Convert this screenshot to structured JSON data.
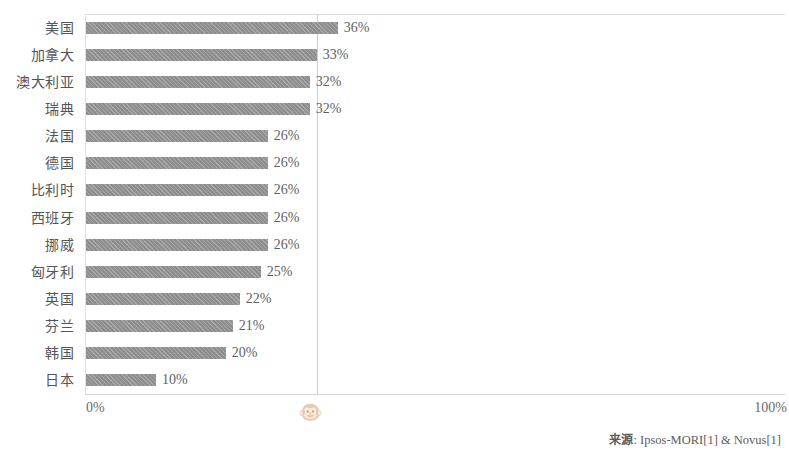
{
  "chart_data": {
    "type": "bar",
    "orientation": "horizontal",
    "title": "",
    "subtitle": "",
    "xlabel": "",
    "ylabel": "",
    "xlim": [
      0,
      100
    ],
    "x_tick_labels": [
      "0%",
      "100%"
    ],
    "grid": true,
    "gridlines_at": [
      33
    ],
    "legend": null,
    "categories": [
      "美国",
      "加拿大",
      "澳大利亚",
      "瑞典",
      "法国",
      "德国",
      "比利时",
      "西班牙",
      "挪威",
      "匈牙利",
      "英国",
      "芬兰",
      "韩国",
      "日本"
    ],
    "values": [
      36,
      33,
      32,
      32,
      26,
      26,
      26,
      26,
      26,
      25,
      22,
      21,
      20,
      10
    ],
    "data_labels": [
      "36%",
      "33%",
      "32%",
      "32%",
      "26%",
      "26%",
      "26%",
      "26%",
      "26%",
      "25%",
      "22%",
      "21%",
      "20%",
      "10%"
    ],
    "bar_color": "#8e8e8e",
    "series": [
      {
        "name": "",
        "values": [
          36,
          33,
          32,
          32,
          26,
          26,
          26,
          26,
          26,
          25,
          22,
          21,
          20,
          10
        ]
      }
    ]
  },
  "axis": {
    "min_label": "0%",
    "max_label": "100%"
  },
  "watermark": {
    "icon": "monkey-face-icon",
    "glyph": "🐵"
  },
  "footer": {
    "source_label": "来源",
    "source_separator": ": ",
    "source_text": "Ipsos-MORI[1] & Novus[1]",
    "full": "来源: Ipsos-MORI[1] & Novus[1]"
  }
}
